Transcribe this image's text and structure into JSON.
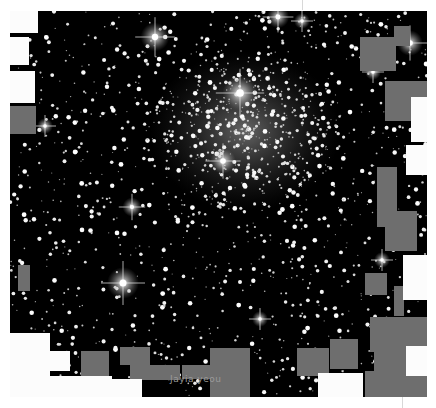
{
  "image": {
    "subject": "star cluster field with masked detector regions",
    "frame": {
      "x": 10,
      "y": 11,
      "width": 417,
      "height": 386
    },
    "colors": {
      "sky": "#000000",
      "mask_gray": "#6e6e6e",
      "mask_white": "#fcfcfc",
      "star": "#ffffff"
    },
    "caption": "Jayia yeou",
    "bright_stars": [
      {
        "x": 145,
        "y": 26,
        "r": 9
      },
      {
        "x": 268,
        "y": 6,
        "r": 7
      },
      {
        "x": 230,
        "y": 82,
        "r": 11
      },
      {
        "x": 213,
        "y": 150,
        "r": 8
      },
      {
        "x": 113,
        "y": 272,
        "r": 10
      },
      {
        "x": 122,
        "y": 196,
        "r": 6
      },
      {
        "x": 400,
        "y": 32,
        "r": 8
      },
      {
        "x": 363,
        "y": 61,
        "r": 5
      },
      {
        "x": 250,
        "y": 308,
        "r": 5
      },
      {
        "x": 35,
        "y": 115,
        "r": 5
      },
      {
        "x": 292,
        "y": 10,
        "r": 5
      },
      {
        "x": 372,
        "y": 249,
        "r": 5
      }
    ],
    "gray_masks": [
      {
        "x": 0,
        "y": 95,
        "w": 26,
        "h": 28
      },
      {
        "x": 8,
        "y": 254,
        "w": 12,
        "h": 26
      },
      {
        "x": 71,
        "y": 340,
        "w": 28,
        "h": 25
      },
      {
        "x": 110,
        "y": 336,
        "w": 30,
        "h": 18
      },
      {
        "x": 120,
        "y": 354,
        "w": 50,
        "h": 15
      },
      {
        "x": 172,
        "y": 354,
        "w": 40,
        "h": 14
      },
      {
        "x": 200,
        "y": 337,
        "w": 40,
        "h": 49
      },
      {
        "x": 287,
        "y": 337,
        "w": 32,
        "h": 28
      },
      {
        "x": 320,
        "y": 328,
        "w": 28,
        "h": 30
      },
      {
        "x": 350,
        "y": 26,
        "w": 36,
        "h": 34
      },
      {
        "x": 384,
        "y": 15,
        "w": 16,
        "h": 20
      },
      {
        "x": 375,
        "y": 70,
        "w": 30,
        "h": 40
      },
      {
        "x": 395,
        "y": 70,
        "w": 22,
        "h": 20
      },
      {
        "x": 367,
        "y": 156,
        "w": 20,
        "h": 60
      },
      {
        "x": 375,
        "y": 200,
        "w": 32,
        "h": 40
      },
      {
        "x": 355,
        "y": 262,
        "w": 22,
        "h": 22
      },
      {
        "x": 384,
        "y": 275,
        "w": 10,
        "h": 30
      },
      {
        "x": 360,
        "y": 306,
        "w": 57,
        "h": 35
      },
      {
        "x": 364,
        "y": 341,
        "w": 32,
        "h": 20
      },
      {
        "x": 355,
        "y": 360,
        "w": 62,
        "h": 26
      }
    ],
    "white_masks": [
      {
        "x": 0,
        "y": 0,
        "w": 28,
        "h": 22
      },
      {
        "x": 0,
        "y": 26,
        "w": 19,
        "h": 28
      },
      {
        "x": 0,
        "y": 60,
        "w": 25,
        "h": 32
      },
      {
        "x": 0,
        "y": 322,
        "w": 40,
        "h": 64
      },
      {
        "x": 40,
        "y": 340,
        "w": 20,
        "h": 20
      },
      {
        "x": 22,
        "y": 365,
        "w": 80,
        "h": 21
      },
      {
        "x": 102,
        "y": 368,
        "w": 30,
        "h": 18
      },
      {
        "x": 308,
        "y": 362,
        "w": 45,
        "h": 24
      },
      {
        "x": 401,
        "y": 86,
        "w": 16,
        "h": 45
      },
      {
        "x": 396,
        "y": 134,
        "w": 21,
        "h": 30
      },
      {
        "x": 393,
        "y": 244,
        "w": 24,
        "h": 45
      },
      {
        "x": 396,
        "y": 335,
        "w": 21,
        "h": 30
      }
    ]
  }
}
